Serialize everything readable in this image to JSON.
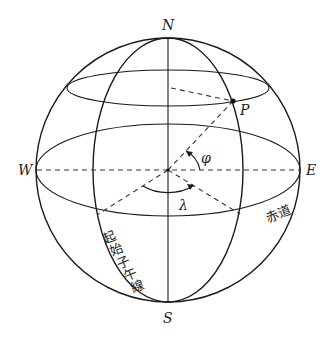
{
  "diagram": {
    "labels": {
      "north": "N",
      "south": "S",
      "west": "W",
      "east": "E",
      "point": "P",
      "latitude_angle": "φ",
      "longitude_angle": "λ",
      "equator": "赤道",
      "prime_meridian": "起始子午線"
    },
    "prime_meridian_chars": [
      "起",
      "始",
      "子",
      "午",
      "線"
    ],
    "colors": {
      "stroke": "#1a1a1a",
      "background": "#ffffff"
    }
  }
}
